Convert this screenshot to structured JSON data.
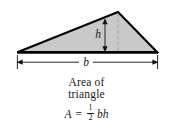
{
  "figure": {
    "kind": "geometry-diagram",
    "shape": "triangle",
    "caption_line1": "Area of",
    "caption_line2": "triangle"
  },
  "labels": {
    "base": "b",
    "height": "h"
  },
  "formula": {
    "lhs": "A",
    "equals": "=",
    "fraction_numerator": "1",
    "fraction_denominator": "2",
    "rhs_vars": "bh",
    "plain": "A = 1/2 bh"
  },
  "colors": {
    "fill": "#c9c9c9",
    "outline": "#000000",
    "text": "#1a1a1a",
    "dimension_line": "#000000",
    "dashed_line": "#8a8a8a",
    "background": "#ffffff"
  },
  "geometry": {
    "triangle_vertices": [
      [
        18,
        52
      ],
      [
        157,
        52
      ],
      [
        118,
        12
      ]
    ],
    "base_dimension_y": 62,
    "base_dimension_x_start": 17,
    "base_dimension_x_end": 158,
    "height_arrow_x": 105,
    "height_arrow_y_top": 20,
    "height_arrow_y_bottom": 51,
    "dashed_drop_x": 118
  }
}
